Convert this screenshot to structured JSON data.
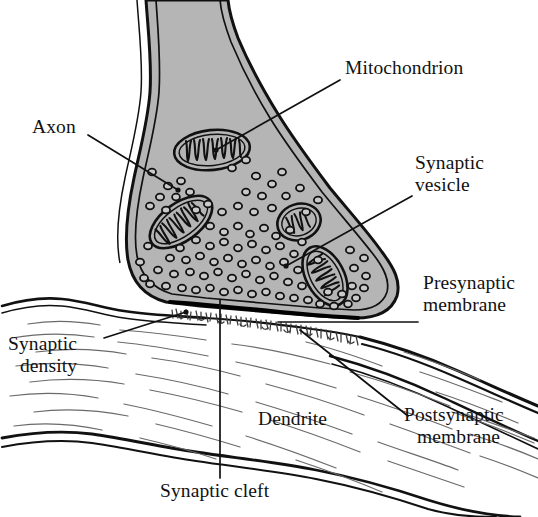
{
  "figure": {
    "type": "biological-diagram",
    "background_color": "#ffffff",
    "cytoplasm_fill": "#b5b5b5",
    "outline_color": "#000000",
    "dendrite_fill": "#ffffff"
  },
  "labels": {
    "mitochondrion": "Mitochondrion",
    "synaptic_vesicle_line1": "Synaptic",
    "synaptic_vesicle_line2": "vesicle",
    "presynaptic_line1": "Presynaptic",
    "presynaptic_line2": "membrane",
    "postsynaptic_line1": "Postsynaptic",
    "postsynaptic_line2": "membrane",
    "axon": "Axon",
    "synaptic_density_line1": "Synaptic",
    "synaptic_density_line2": "density",
    "dendrite": "Dendrite",
    "synaptic_cleft": "Synaptic cleft"
  },
  "structures": [
    {
      "name": "axon-terminal",
      "description": "presynaptic axon terminal bouton, gray cytoplasm with double membrane"
    },
    {
      "name": "mitochondrion-1",
      "description": "elongated mitochondrion upper left with cristae"
    },
    {
      "name": "mitochondrion-2",
      "description": "tilted mitochondrion middle left with cristae"
    },
    {
      "name": "mitochondrion-3",
      "description": "small round mitochondrion upper right"
    },
    {
      "name": "mitochondrion-4",
      "description": "elongated mitochondrion lower right with cristae"
    },
    {
      "name": "synaptic-vesicles",
      "description": "cluster of small round vesicles in terminal cytoplasm"
    },
    {
      "name": "presynaptic-membrane",
      "description": "thick dark membrane at base of terminal"
    },
    {
      "name": "synaptic-cleft",
      "description": "gap between presynaptic and postsynaptic membranes"
    },
    {
      "name": "postsynaptic-density",
      "description": "fuzzy dense material in the cleft"
    },
    {
      "name": "dendrite",
      "description": "postsynaptic dendrite with wavy cytoskeletal filaments"
    }
  ]
}
